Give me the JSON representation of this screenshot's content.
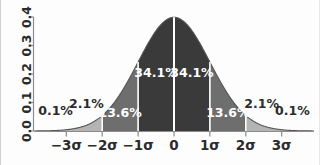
{
  "figure": {
    "background": "#fdfdfd",
    "width": 320,
    "height": 165
  },
  "colors": {
    "core": "#3a3a3a",
    "mid": "#6e6e6e",
    "tail": "#b4b4b4",
    "curve": "#555555",
    "axis": "#8c8c8c",
    "divider": "#ffffff",
    "text_dark": "#2b2b2b",
    "text_light": "#ffffff"
  },
  "yaxis": {
    "ticks": [
      "0.0",
      "0.1",
      "0.2",
      "0.3",
      "0.4"
    ],
    "values": [
      0.0,
      0.1,
      0.2,
      0.3,
      0.4
    ],
    "label_rotation": "90"
  },
  "xaxis": {
    "ticks": [
      "−3σ",
      "−2σ",
      "−1σ",
      "0",
      "1σ",
      "2σ",
      "3σ"
    ],
    "values": [
      -3,
      -2,
      -1,
      0,
      1,
      2,
      3
    ]
  },
  "annotations": [
    {
      "id": "tail-left",
      "text": "0.1%",
      "style": "dark",
      "x": -3.3,
      "y": 0.055
    },
    {
      "id": "band-left-2",
      "text": "2.1%",
      "style": "dark",
      "x": -2.44,
      "y": 0.082
    },
    {
      "id": "band-left-1",
      "text": "13.6%",
      "style": "light",
      "x": -1.5,
      "y": 0.05
    },
    {
      "id": "core-left",
      "text": "34.1%",
      "style": "light",
      "x": -0.5,
      "y": 0.19
    },
    {
      "id": "core-right",
      "text": "34.1%",
      "style": "light",
      "x": 0.5,
      "y": 0.19
    },
    {
      "id": "band-right-1",
      "text": "13.6%",
      "style": "light",
      "x": 1.5,
      "y": 0.05
    },
    {
      "id": "band-right-2",
      "text": "2.1%",
      "style": "dark",
      "x": 2.44,
      "y": 0.082
    },
    {
      "id": "tail-right",
      "text": "0.1%",
      "style": "dark",
      "x": 3.3,
      "y": 0.055
    }
  ],
  "chart_data": {
    "type": "area",
    "title": "",
    "xlabel": "",
    "ylabel": "",
    "xlim": [
      -3.9,
      3.9
    ],
    "ylim": [
      0.0,
      0.42
    ],
    "grid": false,
    "legend": "none",
    "distribution": "standard normal (mean 0, sd 1)",
    "peak_value": 0.399,
    "x": [
      -3.9,
      -3.6,
      -3.3,
      -3.0,
      -2.7,
      -2.4,
      -2.1,
      -1.8,
      -1.5,
      -1.2,
      -0.9,
      -0.6,
      -0.3,
      0.0,
      0.3,
      0.6,
      0.9,
      1.2,
      1.5,
      1.8,
      2.1,
      2.4,
      2.7,
      3.0,
      3.3,
      3.6,
      3.9
    ],
    "y": [
      0.0002,
      0.0006,
      0.0017,
      0.0044,
      0.0104,
      0.0224,
      0.044,
      0.079,
      0.1295,
      0.1942,
      0.2661,
      0.3332,
      0.3814,
      0.3989,
      0.3814,
      0.3332,
      0.2661,
      0.1942,
      0.1295,
      0.079,
      0.044,
      0.0224,
      0.0104,
      0.0044,
      0.0017,
      0.0006,
      0.0002
    ],
    "bands": [
      {
        "label": "0.1%",
        "from": -4.0,
        "to": -3.0,
        "percent": 0.1,
        "shade": "tail"
      },
      {
        "label": "2.1%",
        "from": -3.0,
        "to": -2.0,
        "percent": 2.1,
        "shade": "tail"
      },
      {
        "label": "13.6%",
        "from": -2.0,
        "to": -1.0,
        "percent": 13.6,
        "shade": "mid"
      },
      {
        "label": "34.1%",
        "from": -1.0,
        "to": 0.0,
        "percent": 34.1,
        "shade": "core"
      },
      {
        "label": "34.1%",
        "from": 0.0,
        "to": 1.0,
        "percent": 34.1,
        "shade": "core"
      },
      {
        "label": "13.6%",
        "from": 1.0,
        "to": 2.0,
        "percent": 13.6,
        "shade": "mid"
      },
      {
        "label": "2.1%",
        "from": 2.0,
        "to": 3.0,
        "percent": 2.1,
        "shade": "tail"
      },
      {
        "label": "0.1%",
        "from": 3.0,
        "to": 4.0,
        "percent": 0.1,
        "shade": "tail"
      }
    ],
    "dividers": [
      -2,
      -1,
      0,
      1,
      2
    ]
  }
}
